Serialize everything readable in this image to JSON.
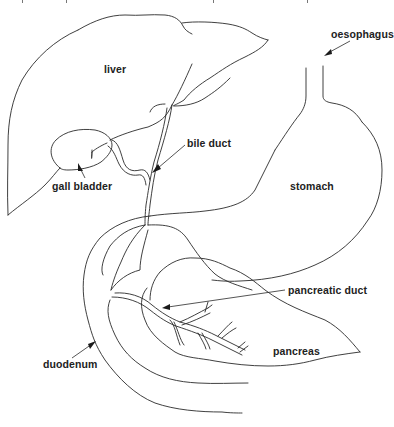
{
  "figure": {
    "type": "anatomical line drawing",
    "labels": {
      "liver": "liver",
      "oesophagus": "oesophagus",
      "bile_duct": "bile duct",
      "gall_bladder": "gall bladder",
      "stomach": "stomach",
      "pancreatic_duct": "pancreatic duct",
      "duodenum": "duodenum",
      "pancreas": "pancreas"
    },
    "colors": {
      "line": "#2a2a2a",
      "text": "#222222",
      "background": "#ffffff"
    }
  }
}
